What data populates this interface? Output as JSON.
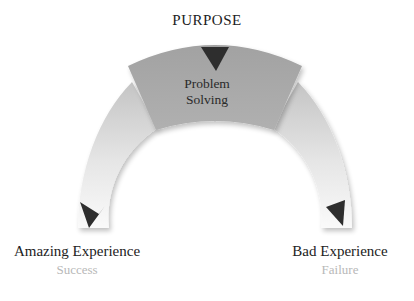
{
  "diagram": {
    "top": {
      "label": "PURPOSE"
    },
    "center": {
      "line1": "Problem",
      "line2": "Solving"
    },
    "left": {
      "title": "Amazing Experience",
      "subtitle": "Success"
    },
    "right": {
      "title": "Bad Experience",
      "subtitle": "Failure"
    },
    "colors": {
      "sector": "#a6a6a6",
      "arc_light": "#f4f4f4",
      "arc_mid": "#c9c9c9",
      "arrow": "#2e2e2e",
      "subtitle": "#b8b8b8"
    }
  }
}
